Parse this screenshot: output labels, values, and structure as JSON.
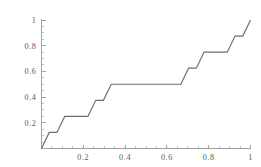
{
  "figure": {
    "title": "",
    "background_color": "#ffffff",
    "curve_color": "#6e6e6e",
    "axis_color": "#8c8c8c",
    "label_color": "#5a5a5a"
  },
  "chart_data": {
    "type": "line",
    "title": "",
    "subtitle": "",
    "xlabel": "",
    "ylabel": "",
    "xlim": [
      0,
      1
    ],
    "ylim": [
      0,
      1
    ],
    "grid": false,
    "legend": null,
    "legend_position": "none",
    "annotations": [],
    "x_ticks": [
      0.2,
      0.4,
      0.6,
      0.8,
      1
    ],
    "x_tick_labels": [
      "0.2",
      "0.4",
      "0.6",
      "0.8",
      "1"
    ],
    "y_ticks": [
      0.2,
      0.4,
      0.6,
      0.8,
      1
    ],
    "y_tick_labels": [
      "0.2",
      "0.4",
      "0.6",
      "0.8",
      "1"
    ],
    "x_minor_ticks": [
      0.05,
      0.1,
      0.15,
      0.25,
      0.3,
      0.35,
      0.45,
      0.5,
      0.55,
      0.65,
      0.7,
      0.75,
      0.85,
      0.9,
      0.95
    ],
    "y_minor_ticks": [
      0.05,
      0.1,
      0.15,
      0.25,
      0.3,
      0.35,
      0.45,
      0.5,
      0.55,
      0.65,
      0.7,
      0.75,
      0.85,
      0.9,
      0.95
    ],
    "series": [
      {
        "name": "Cantor function",
        "x": [
          0,
          0.037037,
          0.074074,
          0.111111,
          0.222222,
          0.259259,
          0.296296,
          0.333333,
          0.666667,
          0.703704,
          0.740741,
          0.777778,
          0.888889,
          0.925926,
          0.962963,
          1
        ],
        "y": [
          0,
          0.125,
          0.125,
          0.25,
          0.25,
          0.375,
          0.375,
          0.5,
          0.5,
          0.625,
          0.625,
          0.75,
          0.75,
          0.875,
          0.875,
          1
        ],
        "points": [
          [
            0,
            0
          ],
          [
            0.037037,
            0.125
          ],
          [
            0.074074,
            0.125
          ],
          [
            0.111111,
            0.25
          ],
          [
            0.222222,
            0.25
          ],
          [
            0.259259,
            0.375
          ],
          [
            0.296296,
            0.375
          ],
          [
            0.333333,
            0.5
          ],
          [
            0.666667,
            0.5
          ],
          [
            0.703704,
            0.625
          ],
          [
            0.740741,
            0.625
          ],
          [
            0.777778,
            0.75
          ],
          [
            0.888889,
            0.75
          ],
          [
            0.925926,
            0.875
          ],
          [
            0.962963,
            0.875
          ],
          [
            1,
            1
          ]
        ]
      }
    ]
  }
}
